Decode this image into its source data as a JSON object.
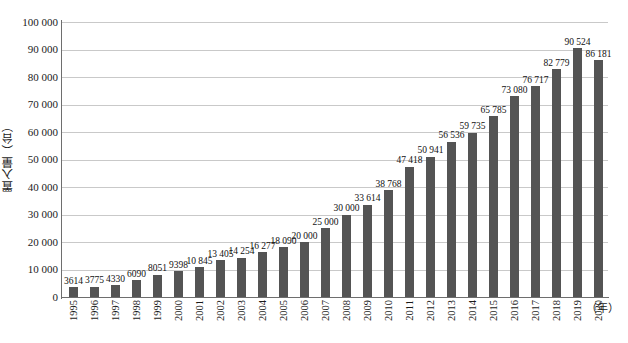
{
  "chart_data": {
    "type": "bar",
    "title": "",
    "xlabel": "（年）",
    "ylabel": "置入量（台）",
    "ylim": [
      0,
      100000
    ],
    "ytick_step": 10000,
    "grid": true,
    "legend": null,
    "bar_color": "#545454",
    "gridline_color": "#c9c9c9",
    "axis_color": "#6e6e6e",
    "categories": [
      "1995",
      "1996",
      "1997",
      "1998",
      "1999",
      "2000",
      "2001",
      "2002",
      "2003",
      "2004",
      "2005",
      "2006",
      "2007",
      "2008",
      "2009",
      "2010",
      "2011",
      "2012",
      "2013",
      "2014",
      "2015",
      "2016",
      "2017",
      "2018",
      "2019",
      "2020"
    ],
    "values": [
      3614,
      3775,
      4330,
      6090,
      8051,
      9398,
      10845,
      13405,
      14254,
      16277,
      18090,
      20000,
      25000,
      30000,
      33614,
      38768,
      47418,
      50941,
      56536,
      59735,
      65785,
      73080,
      76717,
      82779,
      90524,
      86181
    ],
    "data_labels": [
      "3614",
      "3775",
      "4330",
      "6090",
      "8051",
      "9398",
      "10 845",
      "13 405",
      "14 254",
      "16 277",
      "18 090",
      "20 000",
      "25 000",
      "30 000",
      "33 614",
      "38 768",
      "47 418",
      "50 941",
      "56 536",
      "59 735",
      "65 785",
      "73 080",
      "76 717",
      "82 779",
      "90 524",
      "86 181"
    ],
    "ytick_labels": [
      "100 000",
      "90 000",
      "80 000",
      "70 000",
      "60 000",
      "50 000",
      "40 000",
      "30 000",
      "20 000",
      "10 000",
      "0"
    ],
    "ytick_values": [
      100000,
      90000,
      80000,
      70000,
      60000,
      50000,
      40000,
      30000,
      20000,
      10000,
      0
    ]
  },
  "caption": ""
}
